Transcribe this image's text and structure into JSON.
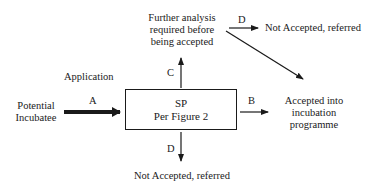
{
  "diagram": {
    "nodes": {
      "potential_incubatee": {
        "line1": "Potential",
        "line2": "Incubatee"
      },
      "sp_box": {
        "line1": "SP",
        "line2": "Per Figure 2"
      },
      "further_analysis": {
        "line1": "Further analysis",
        "line2": "required before",
        "line3": "being accepted"
      },
      "not_accepted_top": {
        "text": "Not Accepted, referred"
      },
      "accepted": {
        "line1": "Accepted into",
        "line2": "incubation",
        "line3": "programme"
      },
      "not_accepted_bottom": {
        "text": "Not Accepted, referred"
      }
    },
    "labels": {
      "application": "Application",
      "edge_a": "A",
      "edge_b": "B",
      "edge_c": "C",
      "edge_d_top": "D",
      "edge_d_bottom": "D"
    },
    "edges": [
      {
        "id": "A",
        "from": "potential_incubatee",
        "to": "sp_box",
        "style": "thick"
      },
      {
        "id": "B",
        "from": "sp_box",
        "to": "accepted"
      },
      {
        "id": "C",
        "from": "sp_box",
        "to": "further_analysis"
      },
      {
        "id": "D",
        "from": "further_analysis",
        "to": "not_accepted_top"
      },
      {
        "id": "",
        "from": "further_analysis",
        "to": "accepted"
      },
      {
        "id": "D",
        "from": "sp_box",
        "to": "not_accepted_bottom"
      }
    ]
  }
}
